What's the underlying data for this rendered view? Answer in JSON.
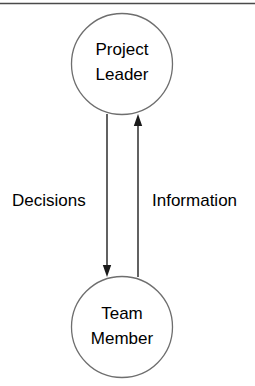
{
  "diagram": {
    "type": "flow-diagram",
    "title": "",
    "background_color": "#ffffff",
    "stroke_color": "#3a3a3a",
    "text_color": "#000000",
    "top_rule": {
      "name": "horizontal-rule",
      "color": "#4a4a4a"
    },
    "nodes": [
      {
        "id": "project-leader",
        "shape": "circle",
        "label_line1": "Project",
        "label_line2": "Leader",
        "cx": 122,
        "cy": 64,
        "r": 50.5
      },
      {
        "id": "team-member",
        "shape": "circle",
        "label_line1": "Team",
        "label_line2": "Member",
        "cx": 122,
        "cy": 327,
        "r": 50.5
      }
    ],
    "edges": [
      {
        "id": "decisions",
        "label": "Decisions",
        "from": "project-leader",
        "to": "team-member",
        "direction": "down",
        "x": 107,
        "label_x": 12,
        "label_y": 202
      },
      {
        "id": "information",
        "label": "Information",
        "from": "team-member",
        "to": "project-leader",
        "direction": "up",
        "x": 138,
        "label_x": 152,
        "label_y": 202
      }
    ]
  }
}
